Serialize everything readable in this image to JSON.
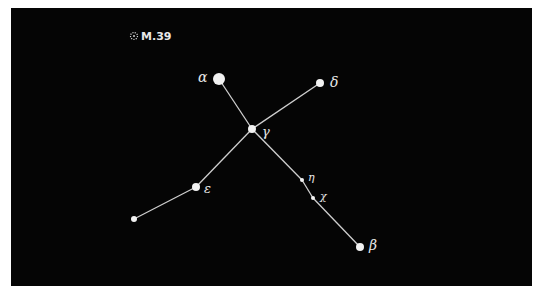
{
  "diagram": {
    "type": "constellation-chart",
    "background": "#050505",
    "line_color": "#cfcfcf",
    "star_color": "#f2f2f2",
    "cluster": {
      "label": "M.39",
      "x": 134,
      "y": 36
    },
    "stars": [
      {
        "id": "alpha",
        "label": "α",
        "x": 219,
        "y": 79,
        "r": 6,
        "label_x": 198,
        "label_y": 82,
        "label_size": 14
      },
      {
        "id": "delta",
        "label": "δ",
        "x": 320,
        "y": 83,
        "r": 4,
        "label_x": 330,
        "label_y": 87,
        "label_size": 14
      },
      {
        "id": "gamma",
        "label": "γ",
        "x": 252,
        "y": 129,
        "r": 4,
        "label_x": 262,
        "label_y": 136,
        "label_size": 13
      },
      {
        "id": "epsilon",
        "label": "ε",
        "x": 196,
        "y": 187,
        "r": 4,
        "label_x": 204,
        "label_y": 193,
        "label_size": 13
      },
      {
        "id": "end",
        "label": "",
        "x": 134,
        "y": 219,
        "r": 3,
        "label_x": 0,
        "label_y": 0,
        "label_size": 0
      },
      {
        "id": "eta",
        "label": "η",
        "x": 302,
        "y": 180,
        "r": 2,
        "label_x": 308,
        "label_y": 181,
        "label_size": 11
      },
      {
        "id": "chi",
        "label": "χ",
        "x": 313,
        "y": 198,
        "r": 2,
        "label_x": 320,
        "label_y": 200,
        "label_size": 11
      },
      {
        "id": "beta",
        "label": "β",
        "x": 360,
        "y": 247,
        "r": 4,
        "label_x": 369,
        "label_y": 250,
        "label_size": 14
      }
    ],
    "lines": [
      {
        "from": "alpha",
        "to": "gamma"
      },
      {
        "from": "delta",
        "to": "gamma"
      },
      {
        "from": "gamma",
        "to": "epsilon"
      },
      {
        "from": "epsilon",
        "to": "end"
      },
      {
        "from": "gamma",
        "to": "eta"
      },
      {
        "from": "eta",
        "to": "chi"
      },
      {
        "from": "chi",
        "to": "beta"
      }
    ]
  }
}
